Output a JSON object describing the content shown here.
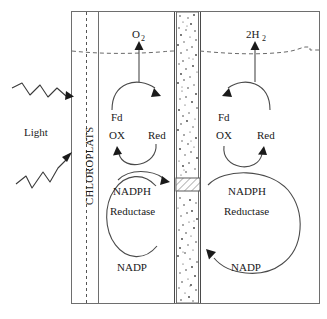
{
  "figure": {
    "background_color": "#ffffff",
    "line_color": "#4a4a4a",
    "text_color": "#1a1a1a"
  },
  "left_exterior": {
    "light_label": "Light",
    "light_ray_count": 2,
    "ray_style": "zigzag-arrow"
  },
  "membrane_label": {
    "text": "CHLOROPLATS",
    "orientation": "vertical-bottom-to-top"
  },
  "water_line": {
    "style": "wavy-dashed",
    "label": ""
  },
  "gas_outputs": {
    "left": {
      "base": "O",
      "subscript": "2"
    },
    "right": {
      "base": "2H",
      "subscript": "2"
    }
  },
  "left_cycle": {
    "ferredoxin_label": "Fd",
    "oxidized_label": "OX",
    "reduced_label": "Red",
    "enzyme_line1": "NADPH",
    "enzyme_line2": "Reductase",
    "cofactor_label": "NADP"
  },
  "right_cycle": {
    "ferredoxin_label": "Fd",
    "oxidized_label": "OX",
    "reduced_label": "Red",
    "enzyme_line1": "NADPH",
    "enzyme_line2": "Reductase",
    "cofactor_label": "NADP"
  },
  "center_membrane": {
    "texture": "stippled",
    "port_style": "diagonal-hatched-box"
  }
}
